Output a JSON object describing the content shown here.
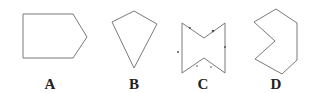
{
  "figure": {
    "shapes": [
      {
        "id": "A",
        "label": "A",
        "description": "pentagon (arrow/house shape pointing right)",
        "points": "23,14 73,14 87,37 73,58 23,58",
        "label_x": 50
      },
      {
        "id": "B",
        "label": "B",
        "description": "kite / convex quadrilateral",
        "points": "112,22 134,11 157,24 134,68",
        "label_x": 134
      },
      {
        "id": "C",
        "label": "C",
        "description": "concave hexagon (bow-tie shape) with tick marks",
        "points": "182,23 204,38 225,23 225,73 204,58 182,73",
        "label_x": 203
      },
      {
        "id": "D",
        "label": "D",
        "description": "concave heptagon",
        "points": "254,22 276,9 297,23 297,60 282,74 255,59 275,41",
        "label_x": 276
      }
    ],
    "colors": {
      "stroke": "#7a7a7a",
      "label": "#222222",
      "background": "#ffffff"
    }
  }
}
